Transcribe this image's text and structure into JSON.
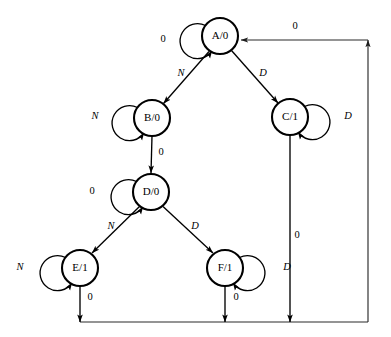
{
  "diagram": {
    "type": "finite-state-machine",
    "title": "",
    "notation": "state/output",
    "states": [
      {
        "id": "A",
        "label": "A/0",
        "name": "A",
        "output": "0",
        "cx": 220,
        "cy": 36,
        "r": 18
      },
      {
        "id": "B",
        "label": "B/0",
        "name": "B",
        "output": "0",
        "cx": 152,
        "cy": 118,
        "r": 18
      },
      {
        "id": "C",
        "label": "C/1",
        "name": "C",
        "output": "1",
        "cx": 290,
        "cy": 117,
        "r": 18
      },
      {
        "id": "D",
        "label": "D/0",
        "name": "D",
        "output": "0",
        "cx": 151,
        "cy": 192,
        "r": 18
      },
      {
        "id": "E",
        "label": "E/1",
        "name": "E",
        "output": "1",
        "cx": 80,
        "cy": 268,
        "r": 18
      },
      {
        "id": "F",
        "label": "F/1",
        "name": "F",
        "output": "1",
        "cx": 225,
        "cy": 268,
        "r": 18
      }
    ],
    "self_loops": [
      {
        "state": "A",
        "label": "0",
        "italic": false,
        "side": "left",
        "lx": 163,
        "ly": 40
      },
      {
        "state": "B",
        "label": "N",
        "italic": true,
        "side": "left",
        "lx": 95,
        "ly": 117
      },
      {
        "state": "C",
        "label": "D",
        "italic": true,
        "side": "right",
        "lx": 348,
        "ly": 117
      },
      {
        "state": "D",
        "label": "0",
        "italic": false,
        "side": "left",
        "lx": 92,
        "ly": 192
      },
      {
        "state": "E",
        "label": "N",
        "italic": true,
        "side": "left",
        "lx": 20,
        "ly": 268
      },
      {
        "state": "F",
        "label": "D",
        "italic": true,
        "side": "right",
        "lx": 287,
        "ly": 268
      }
    ],
    "transitions": [
      {
        "from": "A",
        "to": "B",
        "label": "N",
        "italic": true,
        "lx": 181,
        "ly": 74
      },
      {
        "from": "A",
        "to": "C",
        "label": "D",
        "italic": true,
        "lx": 263,
        "ly": 74
      },
      {
        "from": "B",
        "to": "D",
        "label": "0",
        "italic": false,
        "lx": 161,
        "ly": 153
      },
      {
        "from": "D",
        "to": "E",
        "label": "N",
        "italic": true,
        "lx": 111,
        "ly": 227
      },
      {
        "from": "D",
        "to": "F",
        "label": "D",
        "italic": true,
        "lx": 195,
        "ly": 227
      },
      {
        "from": "C",
        "to": "A",
        "label": "0",
        "italic": false,
        "lx": 297,
        "ly": 236,
        "routed": true
      },
      {
        "from": "E",
        "to": "A",
        "label": "0",
        "italic": false,
        "lx": 90,
        "ly": 298,
        "routed": true
      },
      {
        "from": "F",
        "to": "A",
        "label": "0",
        "italic": false,
        "lx": 236,
        "ly": 298,
        "routed": true
      },
      {
        "from": "return-bus",
        "to": "A",
        "label": "0",
        "italic": false,
        "lx": 295,
        "ly": 27,
        "routed": true
      }
    ]
  }
}
